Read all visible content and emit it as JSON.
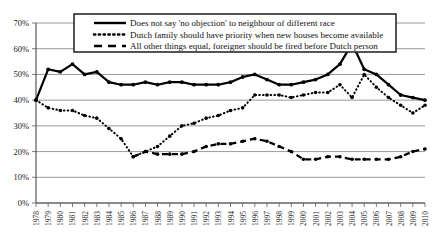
{
  "chart_data": {
    "type": "line",
    "title": "",
    "subtitle": "",
    "xlabel": "",
    "ylabel": "",
    "ylim": [
      0,
      70
    ],
    "ytick_labels": [
      "0%",
      "10%",
      "20%",
      "30%",
      "40%",
      "50%",
      "60%",
      "70%"
    ],
    "ytick_values": [
      0,
      10,
      20,
      30,
      40,
      50,
      60,
      70
    ],
    "grid": true,
    "legend_position": "top-center",
    "x": [
      1978,
      1979,
      1980,
      1981,
      1982,
      1983,
      1984,
      1985,
      1986,
      1987,
      1988,
      1989,
      1990,
      1991,
      1992,
      1993,
      1994,
      1995,
      1996,
      1997,
      1998,
      1999,
      2000,
      2001,
      2002,
      2003,
      2004,
      2005,
      2006,
      2007,
      2008,
      2009,
      2010
    ],
    "categories": [
      "1978",
      "1979",
      "1980",
      "1981",
      "1982",
      "1983",
      "1984",
      "1985",
      "1986",
      "1987",
      "1988",
      "1989",
      "1990",
      "1991",
      "1992",
      "1993",
      "1994",
      "1995",
      "1996",
      "1997",
      "1998",
      "1999",
      "2000",
      "2001",
      "2002",
      "2003",
      "2004",
      "2005",
      "2006",
      "2007",
      "2008",
      "2009",
      "2010"
    ],
    "series": [
      {
        "name": "Does not say 'no objection' to neighbour of different race",
        "style": "solid",
        "values": [
          40,
          52,
          51,
          54,
          50,
          51,
          47,
          46,
          46,
          47,
          46,
          47,
          47,
          46,
          46,
          46,
          47,
          49,
          50,
          48,
          46,
          46,
          47,
          48,
          50,
          54,
          62,
          52,
          50,
          46,
          42,
          41,
          40
        ]
      },
      {
        "name": "Dutch family should have priority when new houses become available",
        "style": "dotted",
        "values": [
          40,
          37,
          36,
          36,
          34,
          33,
          29,
          25,
          18,
          20,
          22,
          26,
          30,
          31,
          33,
          34,
          36,
          37,
          42,
          42,
          42,
          41,
          42,
          43,
          43,
          46,
          41,
          50,
          45,
          41,
          38,
          35,
          38
        ]
      },
      {
        "name": "All other things equal, foreigner should be fired before Dutch person",
        "style": "dashed",
        "values": [
          null,
          null,
          null,
          null,
          null,
          null,
          null,
          null,
          18,
          20,
          19,
          19,
          19,
          20,
          22,
          23,
          23,
          24,
          25,
          24,
          22,
          20,
          17,
          17,
          18,
          18,
          17,
          17,
          17,
          17,
          18,
          20,
          21
        ]
      }
    ]
  },
  "legend": {
    "items": [
      {
        "label": "Does not say 'no objection' to neighbour of different race",
        "style": "solid"
      },
      {
        "label": "Dutch family should have priority when new houses become available",
        "style": "dotted"
      },
      {
        "label": "All other things equal, foreigner should be fired before Dutch person",
        "style": "dashed"
      }
    ]
  },
  "colors": {
    "line": "#000000",
    "grid": "#8e8e8e",
    "axis": "#4a4a4a",
    "background": "#ffffff"
  }
}
